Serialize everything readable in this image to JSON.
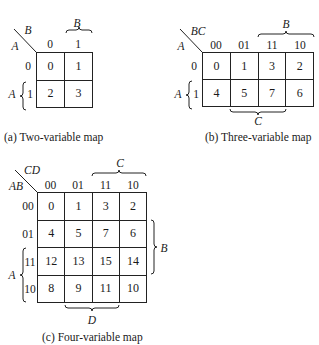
{
  "maps": {
    "two": {
      "caption": "(a) Two-variable map",
      "row_var": "A",
      "col_var": "B",
      "col_headers": [
        "0",
        "1"
      ],
      "row_headers": [
        "0",
        "1"
      ],
      "cells": [
        [
          "0",
          "1"
        ],
        [
          "2",
          "3"
        ]
      ],
      "col_brace_label": "B",
      "row_brace_label": "A"
    },
    "three": {
      "caption": "(b) Three-variable map",
      "row_var": "A",
      "col_var": "BC",
      "col_headers": [
        "00",
        "01",
        "11",
        "10"
      ],
      "row_headers": [
        "0",
        "1"
      ],
      "cells": [
        [
          "0",
          "1",
          "3",
          "2"
        ],
        [
          "4",
          "5",
          "7",
          "6"
        ]
      ],
      "top_brace_label": "B",
      "bottom_brace_label": "C",
      "row_brace_label": "A"
    },
    "four": {
      "caption": "(c) Four-variable map",
      "row_var": "AB",
      "col_var": "CD",
      "col_headers": [
        "00",
        "01",
        "11",
        "10"
      ],
      "row_headers": [
        "00",
        "01",
        "11",
        "10"
      ],
      "cells": [
        [
          "0",
          "1",
          "3",
          "2"
        ],
        [
          "4",
          "5",
          "7",
          "6"
        ],
        [
          "12",
          "13",
          "15",
          "14"
        ],
        [
          "8",
          "9",
          "11",
          "10"
        ]
      ],
      "top_brace_label": "C",
      "right_brace_label": "B",
      "left_brace_label": "A",
      "bottom_brace_label": "D"
    }
  }
}
